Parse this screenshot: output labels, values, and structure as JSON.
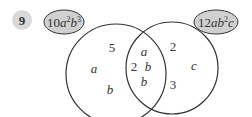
{
  "question": {
    "number": "9",
    "badge_color": "#d9d9d9"
  },
  "sets": {
    "left": {
      "label_coef": "10",
      "label_var1": "a",
      "label_exp1": "2",
      "label_var2": "b",
      "label_exp2": "3",
      "only": [
        "5",
        "a",
        "b"
      ]
    },
    "right": {
      "label_coef": "12",
      "label_var1": "ab",
      "label_exp1": "2",
      "label_var2": "c",
      "only": [
        "2",
        "c",
        "3"
      ]
    },
    "intersection": [
      "a",
      "2",
      "b",
      "b"
    ]
  },
  "colors": {
    "label_fill": "#d0d0d0",
    "stroke": "#333333"
  }
}
